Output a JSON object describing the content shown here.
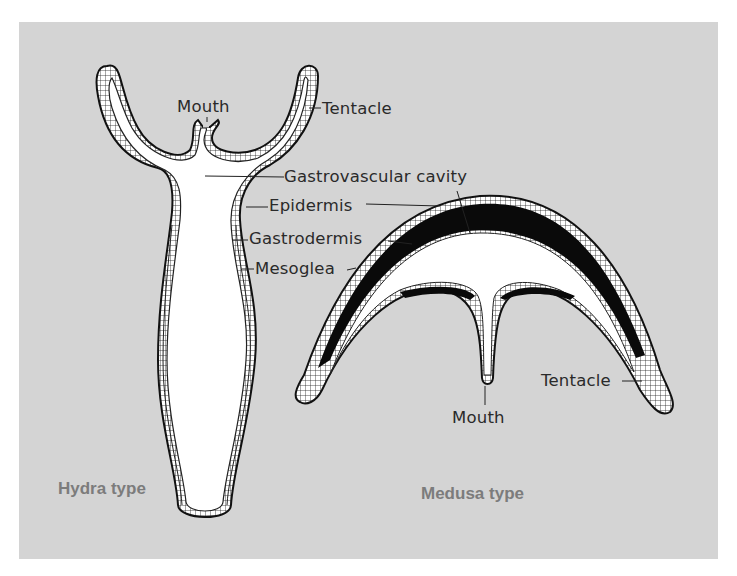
{
  "figure": {
    "background_color": "#d4d4d4",
    "layer_colors": {
      "outline": "#1a1a1a",
      "cavity": "#ffffff",
      "mesoglea_medusa": "#0a0a0a",
      "type_label": "#7c7c7c"
    }
  },
  "hydra": {
    "title": "Hydra type",
    "labels": {
      "mouth": "Mouth",
      "tentacle": "Tentacle",
      "gastrovascular_cavity": "Gastrovascular cavity",
      "epidermis": "Epidermis",
      "gastrodermis": "Gastrodermis",
      "mesoglea": "Mesoglea"
    }
  },
  "medusa": {
    "title": "Medusa type",
    "labels": {
      "tentacle": "Tentacle",
      "mouth": "Mouth"
    }
  }
}
